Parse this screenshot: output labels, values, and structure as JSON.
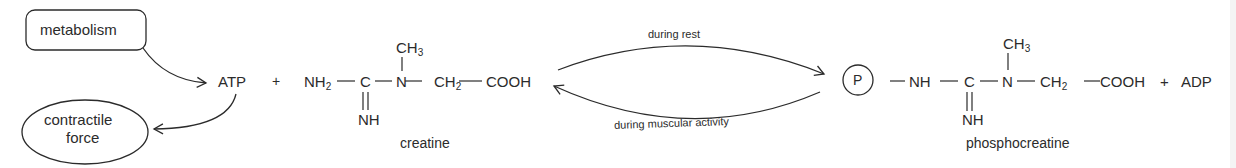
{
  "diagram": {
    "left_nodes": {
      "metabolism": "metabolism",
      "contractile_force_line1": "contractile",
      "contractile_force_line2": "force"
    },
    "reactants": {
      "atp": "ATP",
      "plus": "+",
      "creatine": {
        "nh2": "NH",
        "nh2_sub": "2",
        "c": "C",
        "n": "N",
        "ch3": "CH",
        "ch3_sub": "3",
        "ch2": "CH",
        "ch2_sub": "2",
        "cooh": "COOH",
        "nh": "NH",
        "label": "creatine"
      }
    },
    "arrows": {
      "forward_label": "during rest",
      "reverse_label": "during muscular activity"
    },
    "products": {
      "phosphate": "P",
      "phosphocreatine": {
        "nh_bond": "NH",
        "c": "C",
        "n": "N",
        "ch3": "CH",
        "ch3_sub": "3",
        "ch2": "CH",
        "ch2_sub": "2",
        "cooh": "COOH",
        "nh": "NH",
        "label": "phosphocreatine"
      },
      "plus": "+",
      "adp": "ADP"
    },
    "colors": {
      "ink": "#2b2b2b",
      "background": "#ffffff"
    }
  }
}
